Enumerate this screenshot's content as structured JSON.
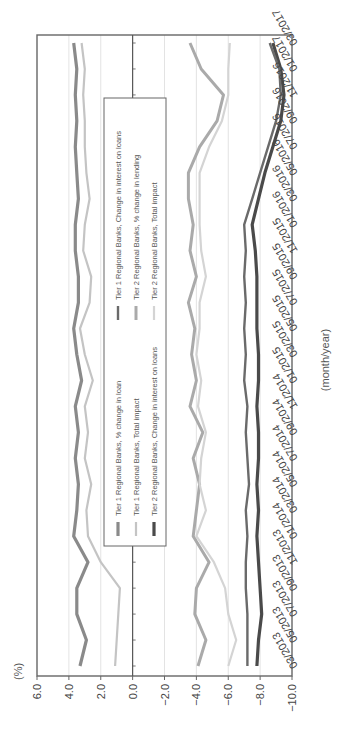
{
  "chart_data": {
    "type": "line",
    "orientation": "rotated 90 degrees clockwise",
    "title": "",
    "xlabel": "(month/year)",
    "ylabel": "(%)",
    "ylim": [
      -10.0,
      6.0
    ],
    "yticks": [
      "6.0",
      "4.0",
      "2.0",
      "0.0",
      "-2.0",
      "-4.0",
      "-6.0",
      "-8.0",
      "-10.0"
    ],
    "x_tick_labels": [
      "03/2013",
      "05/2013",
      "07/2013",
      "09/2013",
      "11/2013",
      "01/2014",
      "03/2014",
      "05/2014",
      "07/2014",
      "09/2014",
      "11/2014",
      "01/2015",
      "03/2015",
      "05/2015",
      "07/2015",
      "09/2015",
      "11/2015",
      "01/2016",
      "03/2016",
      "05/2016",
      "07/2016",
      "09/2016",
      "11/2016",
      "01/2017",
      "03/2017"
    ],
    "grid": "vertical lines at y ticks",
    "legend_position": "inside, upper center",
    "legend": [
      "Tier 1 Regional Banks, % change in loan",
      "Tier 1 Regional Banks, Total impact",
      "Tier 2 Regional Banks, Change in interest on loans",
      "Tier 1 Regional Banks, Change in interest on loans",
      "Tier 2 Regional Banks, % change in lending",
      "Tier 2 Regional Banks, Total impact"
    ],
    "x": [
      "03/2013",
      "05/2013",
      "07/2013",
      "09/2013",
      "11/2013",
      "01/2014",
      "03/2014",
      "05/2014",
      "07/2014",
      "09/2014",
      "11/2014",
      "01/2015",
      "03/2015",
      "05/2015",
      "07/2015",
      "09/2015",
      "11/2015",
      "01/2016",
      "03/2016",
      "05/2016",
      "07/2016",
      "09/2016",
      "11/2016",
      "01/2017",
      "03/2017"
    ],
    "series": [
      {
        "name": "Tier 1 Regional Banks, % change in loan",
        "color": "#8a8a8a",
        "width": 3.2,
        "values": [
          3.3,
          2.9,
          3.5,
          3.5,
          2.8,
          3.7,
          3.5,
          3.4,
          3.6,
          3.4,
          3.6,
          3.2,
          3.5,
          3.7,
          3.4,
          3.4,
          3.6,
          3.6,
          3.4,
          3.5,
          3.6,
          3.5,
          3.6,
          3.5,
          3.7
        ]
      },
      {
        "name": "Tier 1 Regional Banks, Total impact",
        "color": "#c4c4c4",
        "width": 2.2,
        "values": [
          1.1,
          1.0,
          0.9,
          0.8,
          2.0,
          2.8,
          2.9,
          2.6,
          3.0,
          2.8,
          3.0,
          2.5,
          3.0,
          3.3,
          2.7,
          2.6,
          3.1,
          3.0,
          2.7,
          2.9,
          3.0,
          3.0,
          3.1,
          3.0,
          3.2
        ]
      },
      {
        "name": "Tier 2 Regional Banks, Change in interest on loans",
        "color": "#4a4a4a",
        "width": 3.2,
        "values": [
          -7.8,
          -7.9,
          -8.1,
          -8.0,
          -7.9,
          -7.8,
          -7.9,
          -7.8,
          -7.9,
          -7.9,
          -7.8,
          -7.9,
          -7.9,
          -7.8,
          -7.8,
          -7.8,
          -7.7,
          -7.5,
          -7.9,
          -8.3,
          -8.8,
          -9.3,
          -9.5,
          -9.3,
          -8.8
        ]
      },
      {
        "name": "Tier 1 Regional Banks, Change in interest on loans",
        "color": "#6a6a6a",
        "width": 2.4,
        "values": [
          -7.2,
          -7.2,
          -7.2,
          -7.1,
          -7.1,
          -7.2,
          -7.1,
          -7.3,
          -7.2,
          -7.1,
          -7.2,
          -7.0,
          -7.1,
          -7.0,
          -7.1,
          -7.0,
          -7.1,
          -7.0,
          -7.5,
          -8.0,
          -8.5,
          -9.0,
          -9.3,
          -9.2,
          -8.6
        ]
      },
      {
        "name": "Tier 2 Regional Banks, % change in lending",
        "color": "#aaaaaa",
        "width": 3.0,
        "values": [
          -4.1,
          -4.6,
          -3.9,
          -4.0,
          -4.8,
          -3.8,
          -4.0,
          -4.2,
          -3.8,
          -4.4,
          -3.6,
          -4.0,
          -3.7,
          -3.9,
          -3.5,
          -4.0,
          -3.6,
          -3.8,
          -3.5,
          -3.5,
          -4.2,
          -5.3,
          -5.7,
          -4.3,
          -3.6
        ]
      },
      {
        "name": "Tier 2 Regional Banks, Total impact",
        "color": "#d4d4d4",
        "width": 2.2,
        "values": [
          -6.0,
          -6.5,
          -6.0,
          -5.8,
          -5.1,
          -4.0,
          -4.6,
          -4.2,
          -4.3,
          -4.6,
          -4.1,
          -4.3,
          -4.0,
          -4.2,
          -4.2,
          -4.6,
          -4.3,
          -4.2,
          -4.2,
          -4.2,
          -4.8,
          -5.6,
          -6.0,
          -6.0,
          -6.1
        ]
      }
    ]
  }
}
